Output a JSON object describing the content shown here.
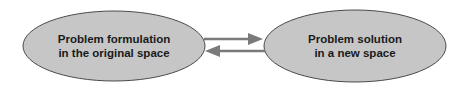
{
  "diagram": {
    "nodes": [
      {
        "id": "original",
        "line1": "Problem formulation",
        "line2": "in the original space"
      },
      {
        "id": "new",
        "line1": "Problem solution",
        "line2": "in a new space"
      }
    ],
    "edges": [
      {
        "from": "original",
        "to": "new",
        "direction": "right"
      },
      {
        "from": "new",
        "to": "original",
        "direction": "left"
      }
    ],
    "colors": {
      "fill": "#c4c4c4",
      "stroke": "#4a4a4a",
      "arrow": "#7a7a7a"
    }
  }
}
